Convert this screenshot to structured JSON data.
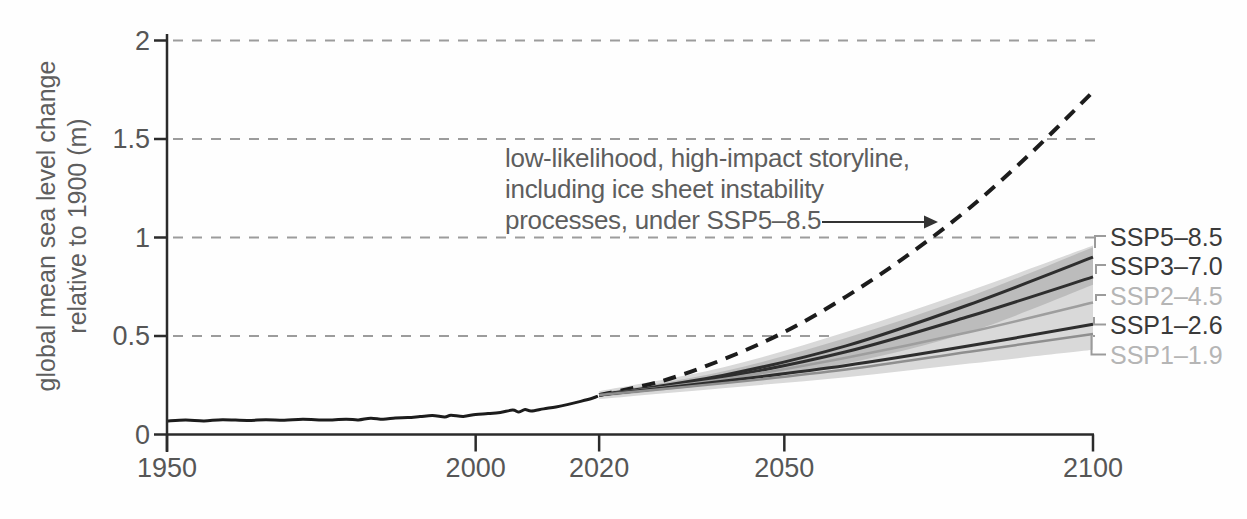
{
  "figure": {
    "background": "#fefefe",
    "text_color": "#5e5e5e",
    "axis_color": "#2b2b2b",
    "grid_color": "#9c9c9c"
  },
  "chart_data": {
    "type": "line",
    "title": "",
    "ylabel_lines": [
      "global mean sea level change",
      "relative to 1900 (m)"
    ],
    "xlabel": "",
    "xlim": [
      1950,
      2100
    ],
    "ylim": [
      0,
      2
    ],
    "x_ticks": [
      "1950",
      "2000",
      "2020",
      "2050",
      "2100"
    ],
    "x_tick_years": [
      1950,
      2000,
      2020,
      2050,
      2100
    ],
    "y_ticks": [
      "0",
      "0.5",
      "1",
      "1.5",
      "2"
    ],
    "y_tick_values": [
      0,
      0.5,
      1,
      1.5,
      2
    ],
    "grid": "dashed horizontal at 0.5, 1, 1.5, 2",
    "legend_position": "right edge labels with leader lines",
    "historical": {
      "name": "observed global mean sea level",
      "color": "#1c1c1c",
      "points": [
        [
          1950,
          0.068
        ],
        [
          1953,
          0.073
        ],
        [
          1956,
          0.069
        ],
        [
          1959,
          0.075
        ],
        [
          1963,
          0.071
        ],
        [
          1966,
          0.075
        ],
        [
          1969,
          0.072
        ],
        [
          1972,
          0.077
        ],
        [
          1976,
          0.073
        ],
        [
          1979,
          0.078
        ],
        [
          1981,
          0.074
        ],
        [
          1983,
          0.083
        ],
        [
          1985,
          0.077
        ],
        [
          1987,
          0.084
        ],
        [
          1989,
          0.086
        ],
        [
          1991,
          0.091
        ],
        [
          1993,
          0.096
        ],
        [
          1995,
          0.089
        ],
        [
          1996,
          0.098
        ],
        [
          1998,
          0.092
        ],
        [
          2000,
          0.102
        ],
        [
          2002,
          0.106
        ],
        [
          2004,
          0.112
        ],
        [
          2006,
          0.124
        ],
        [
          2007,
          0.114
        ],
        [
          2008,
          0.127
        ],
        [
          2009,
          0.119
        ],
        [
          2011,
          0.13
        ],
        [
          2013,
          0.14
        ],
        [
          2015,
          0.153
        ],
        [
          2017,
          0.168
        ],
        [
          2019,
          0.185
        ],
        [
          2019.8,
          0.195
        ]
      ]
    },
    "storyline": {
      "label_lines": [
        "low-likelihood, high-impact storyline,",
        "including ice sheet instability",
        "processes, under SSP5–8.5"
      ],
      "color": "#1c1c1c",
      "style": "dashed",
      "x": [
        2020,
        2030,
        2040,
        2050,
        2060,
        2070,
        2080,
        2090,
        2100
      ],
      "values": [
        0.2,
        0.27,
        0.38,
        0.52,
        0.7,
        0.91,
        1.15,
        1.43,
        1.74
      ]
    },
    "projection_x": [
      2020,
      2040,
      2060,
      2080,
      2100
    ],
    "series": [
      {
        "name": "SSP5-8.5",
        "label": "SSP5–8.5",
        "color": "#2e2e2e",
        "label_color": "#3a3a3a",
        "values": [
          0.2,
          0.3,
          0.45,
          0.66,
          0.9
        ]
      },
      {
        "name": "SSP3-7.0",
        "label": "SSP3–7.0",
        "color": "#2e2e2e",
        "label_color": "#3a3a3a",
        "values": [
          0.2,
          0.29,
          0.42,
          0.6,
          0.8
        ]
      },
      {
        "name": "SSP2-4.5",
        "label": "SSP2–4.5",
        "color": "#9e9e9e",
        "label_color": "#b5b5b5",
        "values": [
          0.2,
          0.28,
          0.39,
          0.52,
          0.67
        ]
      },
      {
        "name": "SSP1-2.6",
        "label": "SSP1–2.6",
        "color": "#2e2e2e",
        "label_color": "#3a3a3a",
        "values": [
          0.2,
          0.27,
          0.35,
          0.45,
          0.56
        ]
      },
      {
        "name": "SSP1-1.9",
        "label": "SSP1–1.9",
        "color": "#8f8f8f",
        "label_color": "#b5b5b5",
        "values": [
          0.2,
          0.26,
          0.33,
          0.42,
          0.51
        ]
      }
    ],
    "bands": [
      {
        "name": "outer-likely-range",
        "color": "#d9d9d9",
        "x": [
          2020,
          2040,
          2060,
          2080,
          2100
        ],
        "hi": [
          0.22,
          0.34,
          0.52,
          0.73,
          0.96
        ],
        "lo": [
          0.18,
          0.235,
          0.29,
          0.36,
          0.43
        ]
      },
      {
        "name": "inner-likely-range",
        "color": "#bcbcbc",
        "x": [
          2020,
          2040,
          2060,
          2080,
          2100
        ],
        "hi": [
          0.21,
          0.32,
          0.49,
          0.7,
          0.95
        ],
        "lo": [
          0.19,
          0.26,
          0.36,
          0.52,
          0.76
        ]
      }
    ]
  }
}
